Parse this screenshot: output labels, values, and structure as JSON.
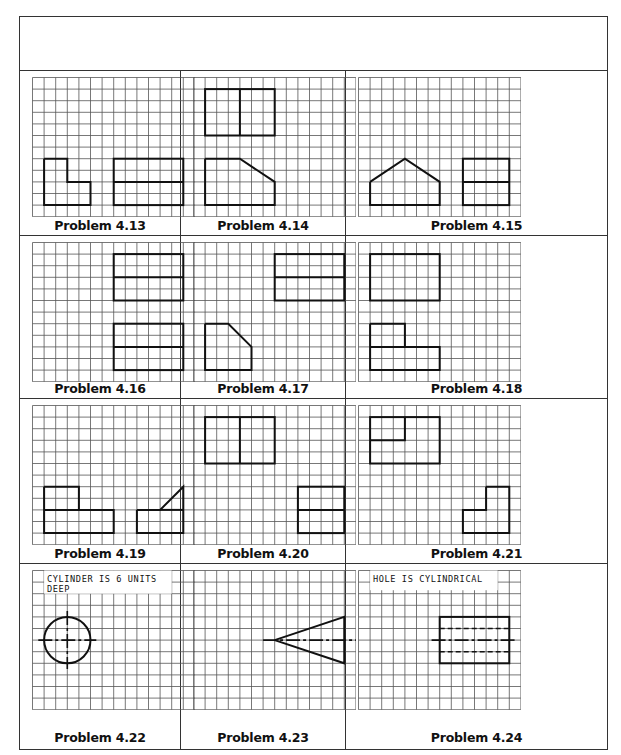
{
  "page": {
    "header_box_text": "",
    "grid": {
      "cols": 14,
      "rows": 12
    },
    "colors": {
      "grid_line": "#555555",
      "shape_line": "#111111",
      "frame": "#333333"
    }
  },
  "problems": [
    {
      "label": "Problem 4.13",
      "note": "",
      "shapes": [
        {
          "type": "poly",
          "points": [
            [
              1,
              7
            ],
            [
              3,
              7
            ],
            [
              3,
              9
            ],
            [
              5,
              9
            ],
            [
              5,
              11
            ],
            [
              1,
              11
            ]
          ]
        },
        {
          "type": "rect",
          "x": 7,
          "y": 7,
          "w": 6,
          "h": 4
        },
        {
          "type": "line",
          "x1": 7,
          "y1": 9,
          "x2": 13,
          "y2": 9
        }
      ]
    },
    {
      "label": "Problem 4.14",
      "note": "",
      "shapes": [
        {
          "type": "rect",
          "x": 1,
          "y": 1,
          "w": 6,
          "h": 4
        },
        {
          "type": "line",
          "x1": 4,
          "y1": 1,
          "x2": 4,
          "y2": 5
        },
        {
          "type": "poly",
          "points": [
            [
              1,
              7
            ],
            [
              4,
              7
            ],
            [
              7,
              9
            ],
            [
              7,
              11
            ],
            [
              1,
              11
            ]
          ]
        }
      ]
    },
    {
      "label": "Problem 4.15",
      "note": "",
      "shapes": [
        {
          "type": "poly",
          "points": [
            [
              1,
              9
            ],
            [
              4,
              7
            ],
            [
              7,
              9
            ],
            [
              7,
              11
            ],
            [
              1,
              11
            ]
          ]
        },
        {
          "type": "rect",
          "x": 9,
          "y": 7,
          "w": 4,
          "h": 4
        },
        {
          "type": "line",
          "x1": 9,
          "y1": 9,
          "x2": 13,
          "y2": 9
        }
      ]
    },
    {
      "label": "Problem 4.16",
      "note": "",
      "shapes": [
        {
          "type": "rect",
          "x": 7,
          "y": 1,
          "w": 6,
          "h": 4
        },
        {
          "type": "line",
          "x1": 7,
          "y1": 3,
          "x2": 13,
          "y2": 3
        },
        {
          "type": "rect",
          "x": 7,
          "y": 7,
          "w": 6,
          "h": 4
        },
        {
          "type": "line",
          "x1": 7,
          "y1": 9,
          "x2": 13,
          "y2": 9
        }
      ]
    },
    {
      "label": "Problem 4.17",
      "note": "",
      "shapes": [
        {
          "type": "rect",
          "x": 7,
          "y": 1,
          "w": 6,
          "h": 4
        },
        {
          "type": "line",
          "x1": 7,
          "y1": 3,
          "x2": 13,
          "y2": 3
        },
        {
          "type": "poly",
          "points": [
            [
              1,
              7
            ],
            [
              3,
              7
            ],
            [
              5,
              9
            ],
            [
              5,
              11
            ],
            [
              1,
              11
            ]
          ]
        }
      ]
    },
    {
      "label": "Problem 4.18",
      "note": "",
      "shapes": [
        {
          "type": "rect",
          "x": 1,
          "y": 1,
          "w": 6,
          "h": 4
        },
        {
          "type": "poly",
          "points": [
            [
              1,
              7
            ],
            [
              4,
              7
            ],
            [
              4,
              9
            ],
            [
              7,
              9
            ],
            [
              7,
              11
            ],
            [
              1,
              11
            ]
          ]
        },
        {
          "type": "line",
          "x1": 1,
          "y1": 9,
          "x2": 4,
          "y2": 9
        }
      ]
    },
    {
      "label": "Problem 4.19",
      "note": "",
      "shapes": [
        {
          "type": "poly",
          "points": [
            [
              1,
              7
            ],
            [
              4,
              7
            ],
            [
              4,
              9
            ],
            [
              7,
              9
            ],
            [
              7,
              11
            ],
            [
              1,
              11
            ]
          ]
        },
        {
          "type": "line",
          "x1": 1,
          "y1": 9,
          "x2": 4,
          "y2": 9
        },
        {
          "type": "poly",
          "points": [
            [
              9,
              9
            ],
            [
              11,
              9
            ],
            [
              13,
              7
            ],
            [
              13,
              11
            ],
            [
              9,
              11
            ]
          ]
        },
        {
          "type": "line",
          "x1": 11,
          "y1": 9,
          "x2": 13,
          "y2": 9
        }
      ]
    },
    {
      "label": "Problem 4.20",
      "note": "",
      "shapes": [
        {
          "type": "rect",
          "x": 1,
          "y": 1,
          "w": 6,
          "h": 4
        },
        {
          "type": "line",
          "x1": 4,
          "y1": 1,
          "x2": 4,
          "y2": 5
        },
        {
          "type": "rect",
          "x": 9,
          "y": 7,
          "w": 4,
          "h": 4
        },
        {
          "type": "line",
          "x1": 9,
          "y1": 9,
          "x2": 13,
          "y2": 9
        }
      ]
    },
    {
      "label": "Problem 4.21",
      "note": "",
      "shapes": [
        {
          "type": "rect",
          "x": 1,
          "y": 1,
          "w": 6,
          "h": 4
        },
        {
          "type": "poly",
          "points": [
            [
              1,
              3
            ],
            [
              4,
              3
            ],
            [
              4,
              1
            ]
          ]
        },
        {
          "type": "poly",
          "points": [
            [
              11,
              7
            ],
            [
              13,
              7
            ],
            [
              13,
              11
            ],
            [
              9,
              11
            ],
            [
              9,
              9
            ],
            [
              11,
              9
            ],
            [
              11,
              7
            ]
          ]
        }
      ]
    },
    {
      "label": "Problem 4.22",
      "note": "CYLINDER IS 6 UNITS DEEP",
      "note_lines": [
        "CYLINDER IS 6 UNITS",
        "DEEP"
      ],
      "shapes": [
        {
          "type": "circle",
          "cx": 3,
          "cy": 6,
          "r": 2
        },
        {
          "type": "centerline",
          "x1": 0.5,
          "y1": 6,
          "x2": 5.5,
          "y2": 6
        },
        {
          "type": "centerline",
          "x1": 3,
          "y1": 3.5,
          "x2": 3,
          "y2": 8.5
        }
      ]
    },
    {
      "label": "Problem 4.23",
      "note": "",
      "shapes": [
        {
          "type": "poly",
          "points": [
            [
              7,
              6
            ],
            [
              13,
              4
            ],
            [
              13,
              8
            ]
          ]
        },
        {
          "type": "centerline",
          "x1": 6,
          "y1": 6,
          "x2": 14,
          "y2": 6
        }
      ]
    },
    {
      "label": "Problem 4.24",
      "note": "HOLE IS CYLINDRICAL",
      "note_lines": [
        "HOLE IS CYLINDRICAL"
      ],
      "shapes": [
        {
          "type": "rect",
          "x": 7,
          "y": 4,
          "w": 6,
          "h": 4
        },
        {
          "type": "hidden",
          "x1": 7,
          "y1": 5,
          "x2": 13,
          "y2": 5
        },
        {
          "type": "hidden",
          "x1": 7,
          "y1": 7,
          "x2": 13,
          "y2": 7
        },
        {
          "type": "centerline",
          "x1": 6.3,
          "y1": 6,
          "x2": 13.7,
          "y2": 6
        }
      ]
    }
  ]
}
